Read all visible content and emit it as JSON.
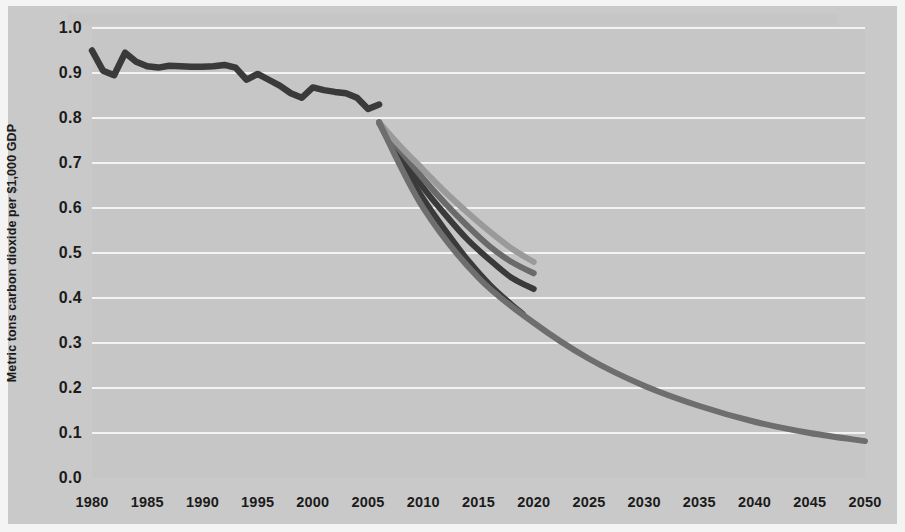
{
  "chart_data": {
    "type": "line",
    "title": "",
    "xlabel": "",
    "ylabel": "Metric tons carbon dioxide per $1,000 GDP",
    "xlim": [
      1980,
      2050
    ],
    "ylim": [
      0.0,
      1.0
    ],
    "grid": true,
    "legend_position": "none",
    "y_ticks": [
      "1.0",
      "0.9",
      "0.8",
      "0.7",
      "0.6",
      "0.5",
      "0.4",
      "0.3",
      "0.2",
      "0.1",
      "0.0"
    ],
    "y_tick_values": [
      1.0,
      0.9,
      0.8,
      0.7,
      0.6,
      0.5,
      0.4,
      0.3,
      0.2,
      0.1,
      0.0
    ],
    "x_ticks": [
      "1980",
      "1985",
      "1990",
      "1995",
      "2000",
      "2005",
      "2010",
      "2015",
      "2020",
      "2025",
      "2030",
      "2035",
      "2040",
      "2045",
      "2050"
    ],
    "x_tick_values": [
      1980,
      1985,
      1990,
      1995,
      2000,
      2005,
      2010,
      2015,
      2020,
      2025,
      2030,
      2035,
      2040,
      2045,
      2050
    ],
    "colors": {
      "history": "#3a3a3a",
      "projection_long": "#6e6e6e",
      "projection_dark": "#3a3a3a",
      "projection_medium": "#6a6a6a",
      "projection_light": "#9a9a9a",
      "plot_background": "#c6c6c6",
      "page_background": "#c9c9c9",
      "gridline": "#f3f3f3",
      "text": "#1b1b1b"
    },
    "series": [
      {
        "name": "Historical carbon intensity",
        "kind": "history",
        "color": "#3a3a3a",
        "x": [
          1980,
          1981,
          1982,
          1983,
          1984,
          1985,
          1986,
          1987,
          1988,
          1989,
          1990,
          1991,
          1992,
          1993,
          1994,
          1995,
          1996,
          1997,
          1998,
          1999,
          2000,
          2001,
          2002,
          2003,
          2004,
          2005,
          2006
        ],
        "values": [
          0.95,
          0.905,
          0.895,
          0.945,
          0.925,
          0.915,
          0.912,
          0.916,
          0.915,
          0.914,
          0.914,
          0.915,
          0.918,
          0.912,
          0.885,
          0.898,
          0.885,
          0.872,
          0.855,
          0.845,
          0.868,
          0.862,
          0.858,
          0.855,
          0.845,
          0.82,
          0.83
        ]
      },
      {
        "name": "Projection A (steepest, lowest 2019 endpoint)",
        "kind": "projection",
        "color": "#3a3a3a",
        "x": [
          2006,
          2008,
          2010,
          2012,
          2014,
          2016,
          2018,
          2019
        ],
        "values": [
          0.79,
          0.7,
          0.62,
          0.55,
          0.485,
          0.43,
          0.385,
          0.365
        ]
      },
      {
        "name": "Projection B (dark)",
        "kind": "projection",
        "color": "#3a3a3a",
        "x": [
          2006,
          2008,
          2010,
          2012,
          2014,
          2016,
          2018,
          2020
        ],
        "values": [
          0.79,
          0.715,
          0.645,
          0.585,
          0.53,
          0.485,
          0.445,
          0.42
        ]
      },
      {
        "name": "Projection C (medium gray)",
        "kind": "projection",
        "color": "#6a6a6a",
        "x": [
          2006,
          2008,
          2010,
          2012,
          2014,
          2016,
          2018,
          2020
        ],
        "values": [
          0.79,
          0.725,
          0.665,
          0.61,
          0.56,
          0.515,
          0.48,
          0.455
        ]
      },
      {
        "name": "Projection D (light gray, highest 2020 endpoint)",
        "kind": "projection",
        "color": "#9a9a9a",
        "x": [
          2006,
          2008,
          2010,
          2012,
          2014,
          2016,
          2018,
          2020
        ],
        "values": [
          0.79,
          0.735,
          0.685,
          0.635,
          0.59,
          0.548,
          0.51,
          0.48
        ]
      },
      {
        "name": "Long-range projection to 2050",
        "kind": "projection",
        "color": "#6e6e6e",
        "x": [
          2006,
          2010,
          2015,
          2020,
          2025,
          2030,
          2035,
          2040,
          2045,
          2050
        ],
        "values": [
          0.79,
          0.6,
          0.445,
          0.345,
          0.265,
          0.205,
          0.16,
          0.125,
          0.1,
          0.082
        ]
      }
    ]
  }
}
